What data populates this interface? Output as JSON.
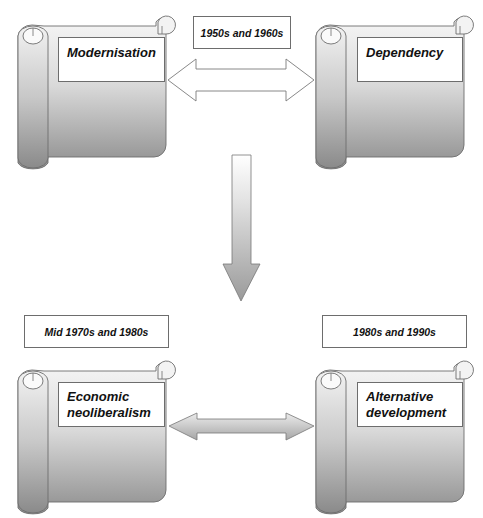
{
  "diagram": {
    "colors": {
      "scroll_top": "#f4f4f4",
      "scroll_bottom": "#8f8f8f",
      "stroke": "#6d6d6d"
    },
    "nodes": [
      {
        "id": "modernisation",
        "label": "Modernisation",
        "period": "1950s and 1960s"
      },
      {
        "id": "dependency",
        "label": "Dependency",
        "period": "1950s and 1960s"
      },
      {
        "id": "economic-neoliberalism",
        "label": "Economic neoliberalism",
        "label_lines": [
          "Economic",
          "neoliberalism"
        ],
        "period": "Mid 1970s and 1980s"
      },
      {
        "id": "alternative-development",
        "label": "Alternative development",
        "label_lines": [
          "Alternative",
          "development"
        ],
        "period": "1980s and 1990s"
      }
    ],
    "date_labels": {
      "top": "1950s and 1960s",
      "bottom_left": "Mid 1970s and 1980s",
      "bottom_right": "1980s and 1990s"
    },
    "scroll_labels": {
      "modernisation": "Modernisation",
      "dependency": "Dependency",
      "neoliberalism_line1": "Economic",
      "neoliberalism_line2": "neoliberalism",
      "alternative_line1": "Alternative",
      "alternative_line2": "development"
    },
    "edges": [
      {
        "from": "modernisation",
        "to": "dependency",
        "type": "double-arrow",
        "style": "outline"
      },
      {
        "from": "top-row",
        "to": "bottom-row",
        "type": "down-arrow",
        "style": "gradient"
      },
      {
        "from": "economic-neoliberalism",
        "to": "alternative-development",
        "type": "double-arrow",
        "style": "gradient"
      }
    ]
  }
}
